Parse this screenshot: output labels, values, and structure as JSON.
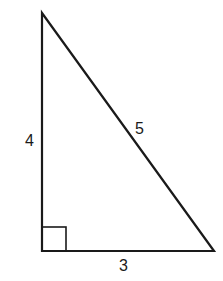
{
  "diagram": {
    "type": "right-triangle",
    "colors": {
      "stroke": "#1a1a1a",
      "background": "#ffffff"
    },
    "vertices": {
      "top": [
        42,
        13
      ],
      "bottom_left": [
        42,
        251
      ],
      "bottom_right": [
        214,
        251
      ]
    },
    "sides": {
      "vertical": {
        "label": "4"
      },
      "hypotenuse": {
        "label": "5"
      },
      "base": {
        "label": "3"
      }
    },
    "right_angle_marker": {
      "corner": "bottom_left",
      "size": 24
    }
  }
}
